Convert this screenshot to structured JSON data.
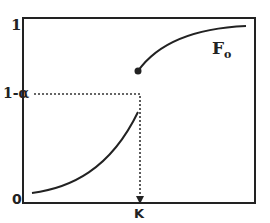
{
  "diagram": {
    "y_labels": {
      "top": "1",
      "mid": "1-α",
      "bottom": "0"
    },
    "x_label": "K",
    "curve_label": {
      "main": "F",
      "sub": "o"
    },
    "colors": {
      "line": "#222222",
      "background": "#ffffff"
    }
  }
}
